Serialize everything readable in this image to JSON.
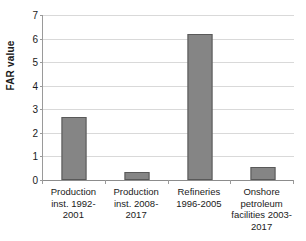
{
  "chart_data": {
    "type": "bar",
    "title": "",
    "xlabel": "",
    "ylabel": "FAR value",
    "categories": [
      "Production inst. 1992-2001",
      "Production inst. 2008-2017",
      "Refineries 1996-2005",
      "Onshore petroleum facilities 2003-2017"
    ],
    "values": [
      2.67,
      0.34,
      6.2,
      0.55
    ],
    "ylim": [
      0,
      7
    ],
    "yticks": [
      "0",
      "1",
      "2",
      "3",
      "4",
      "5",
      "6",
      "7"
    ],
    "grid": true,
    "legend": false,
    "series": [
      {
        "name": "FAR value",
        "values": [
          2.67,
          0.34,
          6.2,
          0.55
        ]
      }
    ],
    "colors": {
      "bar_fill": "#858585",
      "bar_border": "#595959",
      "gridline": "#d9d9d9",
      "axis": "#8c8c8c",
      "text": "#1a1a1a",
      "background": "#ffffff"
    }
  },
  "axis": {
    "y_title": "FAR value",
    "y_ticks": [
      {
        "label": "7",
        "value": 7
      },
      {
        "label": "6",
        "value": 6
      },
      {
        "label": "5",
        "value": 5
      },
      {
        "label": "4",
        "value": 4
      },
      {
        "label": "3",
        "value": 3
      },
      {
        "label": "2",
        "value": 2
      },
      {
        "label": "1",
        "value": 1
      },
      {
        "label": "0",
        "value": 0
      }
    ]
  },
  "categories": [
    {
      "label": "Production inst. 1992-2001",
      "value": 2.67
    },
    {
      "label": "Production inst. 2008-2017",
      "value": 0.34
    },
    {
      "label": "Refineries 1996-2005",
      "value": 6.2
    },
    {
      "label": "Onshore petroleum facilities 2003-2017",
      "value": 0.55
    }
  ]
}
